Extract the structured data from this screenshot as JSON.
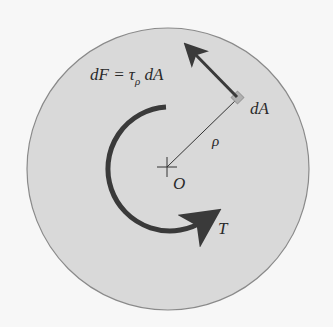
{
  "diagram": {
    "labels": {
      "force_prefix": "dF = τ",
      "force_sub": "ρ",
      "force_suffix": " dA",
      "area": "dA",
      "radius": "ρ",
      "center": "O",
      "torque": "T"
    },
    "colors": {
      "disk_fill": "#d9d9d9",
      "disk_edge": "#8a8a8a",
      "arrow": "#3a3a3a",
      "element": "#b0b0b0"
    }
  }
}
